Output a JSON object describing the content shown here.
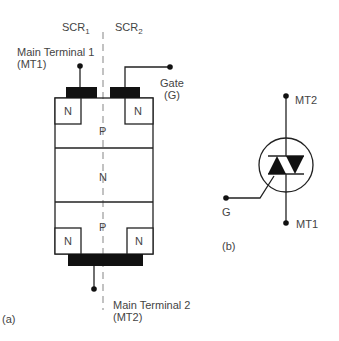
{
  "figure_a": {
    "caption": "(a)",
    "scr1_label": "SCR",
    "scr1_sub": "1",
    "scr2_label": "SCR",
    "scr2_sub": "2",
    "mt1_label_line1": "Main Terminal 1",
    "mt1_label_line2": "(MT1)",
    "gate_label_line1": "Gate",
    "gate_label_line2": "(G)",
    "mt2_label_line1": "Main Terminal 2",
    "mt2_label_line2": "(MT2)",
    "regions": {
      "top_n_left": "N",
      "top_n_right": "N",
      "top_p": "P",
      "middle_n": "N",
      "bottom_p": "P",
      "bottom_n_left": "N",
      "bottom_n_right": "N"
    }
  },
  "figure_b": {
    "caption": "(b)",
    "mt2_label": "MT2",
    "mt1_label": "MT1",
    "gate_label": "G"
  },
  "colors": {
    "line": "#222222",
    "fill": "#111111",
    "dash": "#999999",
    "text": "#444444"
  }
}
